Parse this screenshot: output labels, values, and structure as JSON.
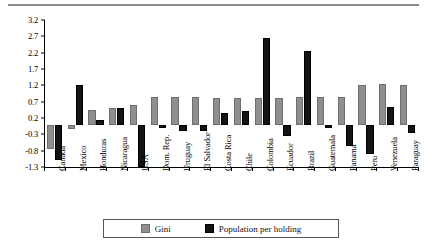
{
  "chart_data": {
    "type": "bar",
    "title": "",
    "subtitle": "",
    "xlabel": "",
    "ylabel": "",
    "grid": false,
    "legend_position": "bottom",
    "ylim": [
      -1.3,
      3.2
    ],
    "yticks": [
      -1.3,
      -0.8,
      -0.3,
      0.2,
      0.7,
      1.2,
      1.7,
      2.2,
      2.7,
      3.2
    ],
    "ytick_labels": [
      "-1.3",
      "-0.8",
      "-0.3",
      "0.2",
      "0.7",
      "1.2",
      "1.7",
      "2.2",
      "2.7",
      "3.2"
    ],
    "categories": [
      "Canada",
      "Mexico",
      "Honduras",
      "Nicaragua",
      "USA",
      "Dom. Rep.",
      "Uruguay",
      "El Salvador",
      "Costa Rica",
      "Chile",
      "Colombia",
      "Ecuador",
      "Brazil",
      "Guatemala",
      "Panama",
      "Peru",
      "Venezuela",
      "Paraguay"
    ],
    "series": [
      {
        "name": "Gini",
        "color": "#8f8f8f",
        "values": [
          -0.75,
          -0.15,
          0.45,
          0.5,
          0.6,
          0.85,
          0.85,
          0.85,
          0.8,
          0.8,
          0.8,
          0.8,
          0.85,
          0.85,
          0.85,
          1.2,
          1.25,
          1.2
        ]
      },
      {
        "name": "Population per holding",
        "color": "#141414",
        "values": [
          -1.1,
          1.2,
          0.15,
          0.52,
          -1.3,
          -0.1,
          -0.2,
          -0.2,
          0.35,
          0.4,
          2.65,
          -0.35,
          2.25,
          -0.1,
          -0.65,
          -0.9,
          0.55,
          -0.25
        ]
      }
    ]
  },
  "legend": {
    "items": [
      {
        "label": "Gini",
        "color": "#8f8f8f"
      },
      {
        "label": "Population per holding",
        "color": "#141414"
      }
    ]
  }
}
